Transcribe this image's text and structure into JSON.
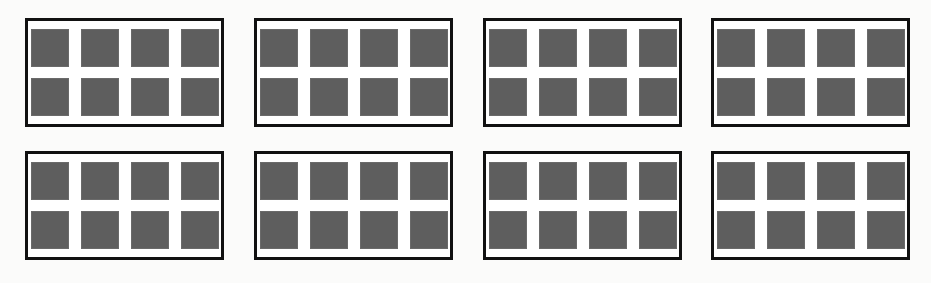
{
  "figure": {
    "background_color": "#fbfbfa",
    "border_color": "#111111",
    "square_color": "#5e5e5e",
    "group_fill_color": "#ffffff",
    "watermark_text": "",
    "layout": {
      "group_rows": 2,
      "group_columns": 4,
      "total_groups": 8,
      "squares_per_group": 8,
      "square_grid_columns": 4,
      "square_grid_rows": 2,
      "total_squares": 64
    }
  },
  "chart_data": {
    "type": "table",
    "xlabel": "",
    "ylabel": "",
    "categories": [
      "Group 1",
      "Group 2",
      "Group 3",
      "Group 4",
      "Group 5",
      "Group 6",
      "Group 7",
      "Group 8"
    ],
    "values": [
      8,
      8,
      8,
      8,
      8,
      8,
      8,
      8
    ],
    "annotations": [
      "8 groups",
      "8 unit squares per group",
      "4 columns x 2 rows per group",
      "64 unit squares total"
    ],
    "grid": false,
    "legend": "none"
  },
  "groups": [
    {
      "id": "group-1",
      "row": 0,
      "column": 0,
      "label": "Group 1",
      "count": 8,
      "squares": [
        {
          "row": 0,
          "col": 0
        },
        {
          "row": 0,
          "col": 1
        },
        {
          "row": 0,
          "col": 2
        },
        {
          "row": 0,
          "col": 3
        },
        {
          "row": 1,
          "col": 0
        },
        {
          "row": 1,
          "col": 1
        },
        {
          "row": 1,
          "col": 2
        },
        {
          "row": 1,
          "col": 3
        }
      ]
    },
    {
      "id": "group-2",
      "row": 0,
      "column": 1,
      "label": "Group 2",
      "count": 8,
      "squares": [
        {
          "row": 0,
          "col": 0
        },
        {
          "row": 0,
          "col": 1
        },
        {
          "row": 0,
          "col": 2
        },
        {
          "row": 0,
          "col": 3
        },
        {
          "row": 1,
          "col": 0
        },
        {
          "row": 1,
          "col": 1
        },
        {
          "row": 1,
          "col": 2
        },
        {
          "row": 1,
          "col": 3
        }
      ]
    },
    {
      "id": "group-3",
      "row": 0,
      "column": 2,
      "label": "Group 3",
      "count": 8,
      "squares": [
        {
          "row": 0,
          "col": 0
        },
        {
          "row": 0,
          "col": 1
        },
        {
          "row": 0,
          "col": 2
        },
        {
          "row": 0,
          "col": 3
        },
        {
          "row": 1,
          "col": 0
        },
        {
          "row": 1,
          "col": 1
        },
        {
          "row": 1,
          "col": 2
        },
        {
          "row": 1,
          "col": 3
        }
      ]
    },
    {
      "id": "group-4",
      "row": 0,
      "column": 3,
      "label": "Group 4",
      "count": 8,
      "squares": [
        {
          "row": 0,
          "col": 0
        },
        {
          "row": 0,
          "col": 1
        },
        {
          "row": 0,
          "col": 2
        },
        {
          "row": 0,
          "col": 3
        },
        {
          "row": 1,
          "col": 0
        },
        {
          "row": 1,
          "col": 1
        },
        {
          "row": 1,
          "col": 2
        },
        {
          "row": 1,
          "col": 3
        }
      ]
    },
    {
      "id": "group-5",
      "row": 1,
      "column": 0,
      "label": "Group 5",
      "count": 8,
      "squares": [
        {
          "row": 0,
          "col": 0
        },
        {
          "row": 0,
          "col": 1
        },
        {
          "row": 0,
          "col": 2
        },
        {
          "row": 0,
          "col": 3
        },
        {
          "row": 1,
          "col": 0
        },
        {
          "row": 1,
          "col": 1
        },
        {
          "row": 1,
          "col": 2
        },
        {
          "row": 1,
          "col": 3
        }
      ]
    },
    {
      "id": "group-6",
      "row": 1,
      "column": 1,
      "label": "Group 6",
      "count": 8,
      "squares": [
        {
          "row": 0,
          "col": 0
        },
        {
          "row": 0,
          "col": 1
        },
        {
          "row": 0,
          "col": 2
        },
        {
          "row": 0,
          "col": 3
        },
        {
          "row": 1,
          "col": 0
        },
        {
          "row": 1,
          "col": 1
        },
        {
          "row": 1,
          "col": 2
        },
        {
          "row": 1,
          "col": 3
        }
      ]
    },
    {
      "id": "group-7",
      "row": 1,
      "column": 2,
      "label": "Group 7",
      "count": 8,
      "squares": [
        {
          "row": 0,
          "col": 0
        },
        {
          "row": 0,
          "col": 1
        },
        {
          "row": 0,
          "col": 2
        },
        {
          "row": 0,
          "col": 3
        },
        {
          "row": 1,
          "col": 0
        },
        {
          "row": 1,
          "col": 1
        },
        {
          "row": 1,
          "col": 2
        },
        {
          "row": 1,
          "col": 3
        }
      ]
    },
    {
      "id": "group-8",
      "row": 1,
      "column": 3,
      "label": "Group 8",
      "count": 8,
      "squares": [
        {
          "row": 0,
          "col": 0
        },
        {
          "row": 0,
          "col": 1
        },
        {
          "row": 0,
          "col": 2
        },
        {
          "row": 0,
          "col": 3
        },
        {
          "row": 1,
          "col": 0
        },
        {
          "row": 1,
          "col": 1
        },
        {
          "row": 1,
          "col": 2
        },
        {
          "row": 1,
          "col": 3
        }
      ]
    }
  ]
}
